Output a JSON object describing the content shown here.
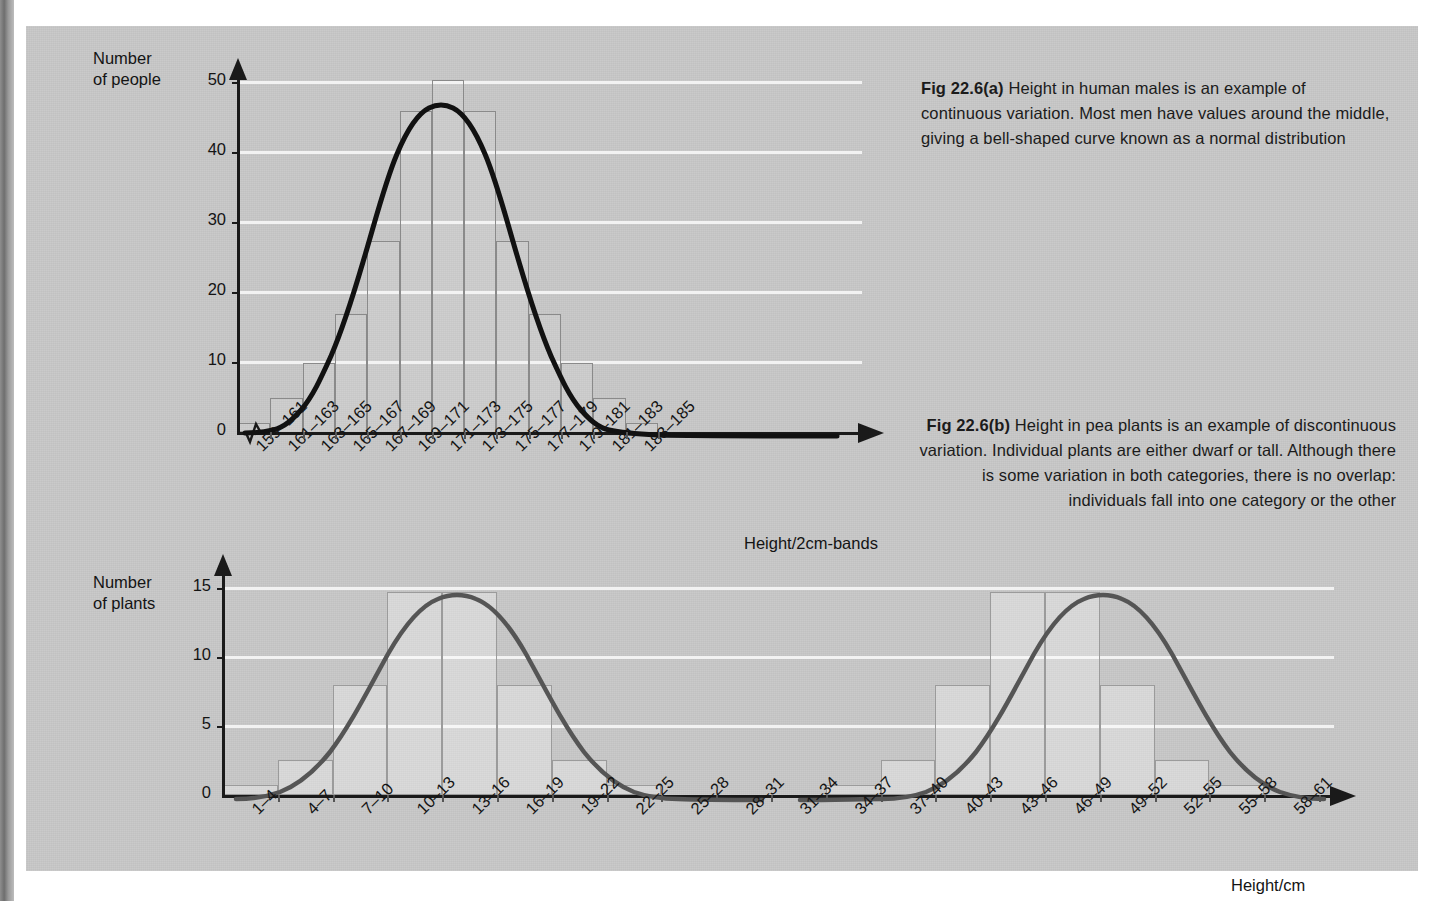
{
  "figure": {
    "captions": {
      "a_bold": "Fig 22.6(a)",
      "a_text": " Height in human males is an example of continuous variation. Most men have values around the middle, giving a bell-shaped curve known as a normal distribution",
      "b_bold": "Fig 22.6(b)",
      "b_text": " Height in pea plants is an example of discontinuous variation. Individual plants are either dwarf or tall. Although there is some variation in both categories, there is no overlap: individuals fall into one category or the other"
    },
    "colors": {
      "panel_bg": "#c8c8c8",
      "gridline": "#f2f2f2",
      "axis": "#1a1a1a",
      "curve_a": "#111111",
      "curve_b": "#555555",
      "bar_stroke": "#8a8a8a",
      "text": "#141414"
    }
  },
  "chart_data": [
    {
      "type": "bar",
      "id": "chart-a",
      "title": "Fig 22.6(a) Height in human males",
      "xlabel": "Height/2cm-bands",
      "ylabel": "Number of people",
      "ylabel_line1": "Number",
      "ylabel_line2": "of people",
      "ylim": [
        0,
        52
      ],
      "yticks": [
        0,
        10,
        20,
        30,
        40,
        50
      ],
      "grid": true,
      "axis_break": true,
      "legend": "none",
      "overlay": "normal-distribution-curve",
      "categories": [
        "159–161",
        "161–163",
        "163–165",
        "165–167",
        "167–169",
        "169–171",
        "171–173",
        "173–175",
        "175–177",
        "177–179",
        "179–181",
        "181–183",
        "183–185"
      ],
      "values": [
        1.5,
        5,
        10,
        17,
        27.5,
        46,
        50.5,
        46,
        27.5,
        17,
        10,
        5,
        1.5
      ]
    },
    {
      "type": "bar",
      "id": "chart-b",
      "title": "Fig 22.6(b) Height in pea plants",
      "xlabel": "Height/cm",
      "ylabel": "Number of plants",
      "ylabel_line1": "Number",
      "ylabel_line2": "of plants",
      "ylim": [
        0,
        16
      ],
      "yticks": [
        0,
        5,
        10,
        15
      ],
      "grid": true,
      "axis_break": false,
      "legend": "none",
      "overlay": "two-normal-distribution-curves",
      "categories": [
        "1–4",
        "4–7",
        "7–10",
        "10–13",
        "13–16",
        "16–19",
        "19–22",
        "22–25",
        "25–28",
        "28–31",
        "31–34",
        "34–37",
        "37–40",
        "40–43",
        "43–46",
        "46–49",
        "49–52",
        "52–55",
        "55–58",
        "58–61"
      ],
      "values": [
        0.7,
        2.5,
        8,
        14.7,
        14.7,
        8,
        2.5,
        0.7,
        0,
        0,
        0,
        0.7,
        2.5,
        8,
        14.7,
        14.7,
        8,
        2.5,
        0.7,
        0
      ]
    }
  ]
}
